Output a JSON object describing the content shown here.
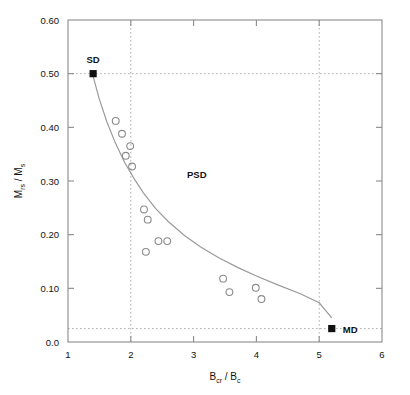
{
  "chart_data": {
    "type": "scatter",
    "title": "",
    "xlabel": "B_cr / B_c",
    "ylabel": "M_rs / M_s",
    "xlabel_parts": {
      "main1": "B",
      "sub1": "cr",
      "sep": " / ",
      "main2": "B",
      "sub2": "c"
    },
    "ylabel_parts": {
      "main1": "M",
      "sub1": "rs",
      "sep": " / ",
      "main2": "M",
      "sub2": "s"
    },
    "xlim": [
      1,
      6
    ],
    "ylim": [
      0.0,
      0.6
    ],
    "xticks": [
      1,
      2,
      3,
      4,
      5,
      6
    ],
    "xticklabels": [
      "1",
      "2",
      "3",
      "4",
      "5",
      "6"
    ],
    "yticks": [
      0.0,
      0.1,
      0.2,
      0.3,
      0.4,
      0.5,
      0.6
    ],
    "yticklabels": [
      "0.0",
      "0.10",
      "0.20",
      "0.30",
      "0.40",
      "0.50",
      "0.60"
    ],
    "grid": false,
    "legend": "none",
    "reference_lines": {
      "vertical_x": [
        2.0,
        5.0
      ],
      "horizontal_y": [
        0.5,
        0.025
      ],
      "style": "dotted"
    },
    "domain_markers": [
      {
        "label": "SD",
        "x": 1.4,
        "y": 0.5,
        "marker": "filled-square",
        "label_position": "above"
      },
      {
        "label": "MD",
        "x": 5.2,
        "y": 0.025,
        "marker": "filled-square",
        "label_position": "right"
      }
    ],
    "region_labels": [
      {
        "label": "PSD",
        "x": 3.05,
        "y": 0.305
      }
    ],
    "series": [
      {
        "name": "samples",
        "marker": "open-circle",
        "points": [
          {
            "x": 1.76,
            "y": 0.412
          },
          {
            "x": 1.86,
            "y": 0.388
          },
          {
            "x": 1.99,
            "y": 0.365
          },
          {
            "x": 1.92,
            "y": 0.347
          },
          {
            "x": 2.02,
            "y": 0.327
          },
          {
            "x": 2.21,
            "y": 0.247
          },
          {
            "x": 2.27,
            "y": 0.228
          },
          {
            "x": 2.44,
            "y": 0.188
          },
          {
            "x": 2.58,
            "y": 0.188
          },
          {
            "x": 2.24,
            "y": 0.168
          },
          {
            "x": 3.47,
            "y": 0.118
          },
          {
            "x": 3.57,
            "y": 0.093
          },
          {
            "x": 3.99,
            "y": 0.101
          },
          {
            "x": 4.08,
            "y": 0.08
          }
        ]
      }
    ],
    "fit_curve": {
      "name": "mixing-trend",
      "points": [
        {
          "x": 1.4,
          "y": 0.495
        },
        {
          "x": 1.5,
          "y": 0.452
        },
        {
          "x": 1.62,
          "y": 0.41
        },
        {
          "x": 1.75,
          "y": 0.372
        },
        {
          "x": 1.9,
          "y": 0.335
        },
        {
          "x": 2.05,
          "y": 0.305
        },
        {
          "x": 2.2,
          "y": 0.278
        },
        {
          "x": 2.4,
          "y": 0.248
        },
        {
          "x": 2.6,
          "y": 0.224
        },
        {
          "x": 2.85,
          "y": 0.199
        },
        {
          "x": 3.1,
          "y": 0.178
        },
        {
          "x": 3.4,
          "y": 0.157
        },
        {
          "x": 3.7,
          "y": 0.139
        },
        {
          "x": 4.0,
          "y": 0.123
        },
        {
          "x": 4.35,
          "y": 0.106
        },
        {
          "x": 4.7,
          "y": 0.09
        },
        {
          "x": 5.0,
          "y": 0.073
        },
        {
          "x": 5.2,
          "y": 0.045
        }
      ]
    },
    "colors": {
      "axis": "#8a8a8a",
      "marker_edge": "#8a8a8a",
      "curve": "#9a9a9a",
      "reference_line": "#b0b0b0",
      "text": "#111111",
      "filled_marker": "#111111",
      "background": "#ffffff"
    }
  }
}
